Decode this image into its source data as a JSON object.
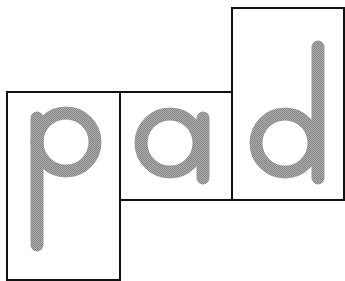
{
  "word": "pad",
  "letters": [
    {
      "char": "p",
      "box": "p-box"
    },
    {
      "char": "a",
      "box": "a-box"
    },
    {
      "char": "d",
      "box": "d-box"
    }
  ],
  "colors": {
    "letter": "#9a9a9a",
    "border": "#111111",
    "background": "#ffffff"
  }
}
